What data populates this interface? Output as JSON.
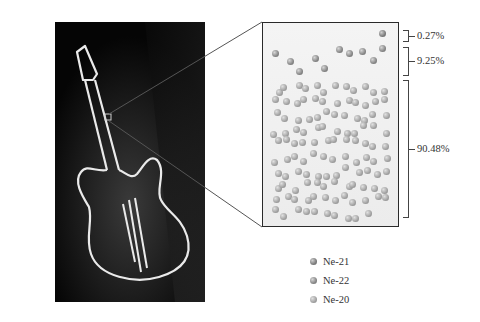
{
  "figure": {
    "photo": {
      "subject": "neon guitar sign",
      "background": "#050505",
      "neon_color": "#f2f2f2"
    },
    "zoom_box": {
      "border_color": "#2a2a2a"
    },
    "isotopes": [
      {
        "name": "Ne-21",
        "percent_label": "0.27%",
        "count": 1,
        "class": "b-ne21"
      },
      {
        "name": "Ne-22",
        "percent_label": "9.25%",
        "count": 10,
        "class": "b-ne22"
      },
      {
        "name": "Ne-20",
        "percent_label": "90.48%",
        "count": 118,
        "class": "b-ne20"
      }
    ],
    "legend": {
      "items": [
        {
          "label": "Ne-21",
          "class": "b-ne21"
        },
        {
          "label": "Ne-22",
          "class": "b-ne22"
        },
        {
          "label": "Ne-20",
          "class": "b-ne20"
        }
      ]
    }
  }
}
